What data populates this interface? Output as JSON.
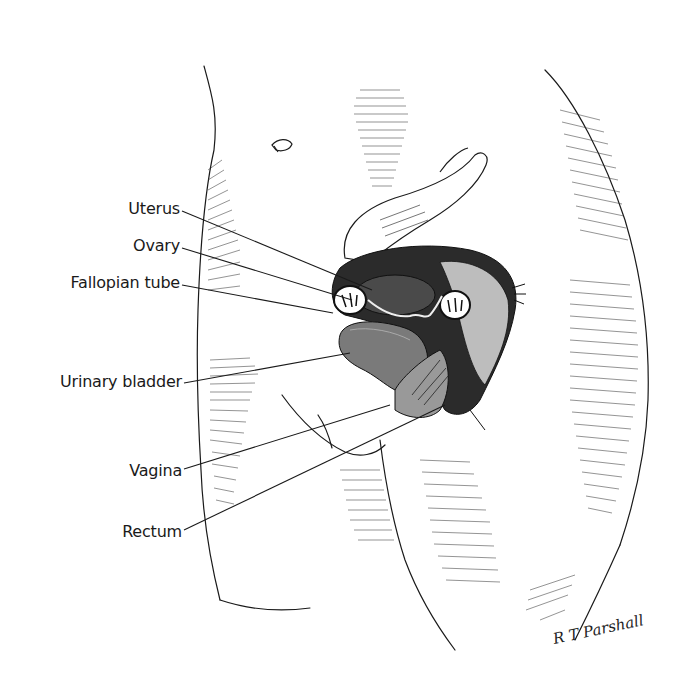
{
  "figure": {
    "type": "anatomical-illustration",
    "labels": [
      {
        "id": "uterus",
        "text": "Uterus",
        "x": 180,
        "y": 209,
        "target": [
          372,
          290
        ]
      },
      {
        "id": "ovary",
        "text": "Ovary",
        "x": 180,
        "y": 245,
        "target": [
          352,
          300
        ]
      },
      {
        "id": "fallopian-tube",
        "text": "Fallopian tube",
        "x": 180,
        "y": 283,
        "target": [
          333,
          313
        ]
      },
      {
        "id": "urinary-bladder",
        "text": "Urinary bladder",
        "x": 180,
        "y": 382,
        "target": [
          350,
          353
        ]
      },
      {
        "id": "vagina",
        "text": "Vagina",
        "x": 180,
        "y": 471,
        "target": [
          390,
          405
        ]
      },
      {
        "id": "rectum",
        "text": "Rectum",
        "x": 180,
        "y": 532,
        "target": [
          445,
          405
        ]
      }
    ],
    "signature": "R T Parshall"
  },
  "colors": {
    "background": "#ffffff",
    "ink": "#1a1a1a",
    "bladder_tone": "#6b6b6b"
  }
}
